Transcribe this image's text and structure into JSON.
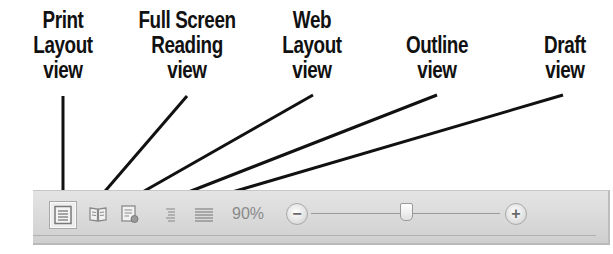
{
  "callouts": [
    {
      "id": "print-layout",
      "label": "Print\nLayout\nview",
      "label_x": 63,
      "line": {
        "x1": 63,
        "y1": 96,
        "x2": 63,
        "y2": 196
      }
    },
    {
      "id": "full-screen-reading",
      "label": "Full Screen\nReading\nview",
      "label_x": 187,
      "line": {
        "x1": 187,
        "y1": 96,
        "x2": 100,
        "y2": 197
      }
    },
    {
      "id": "web-layout",
      "label": "Web\nLayout\nview",
      "label_x": 312,
      "line": {
        "x1": 313,
        "y1": 95,
        "x2": 132,
        "y2": 198
      }
    },
    {
      "id": "outline",
      "label": "Outline\nview",
      "label_x": 437,
      "line": {
        "x1": 437,
        "y1": 95,
        "x2": 168,
        "y2": 200
      }
    },
    {
      "id": "draft",
      "label": "Draft\nview",
      "label_x": 565,
      "line": {
        "x1": 563,
        "y1": 95,
        "x2": 205,
        "y2": 200
      }
    }
  ],
  "statusbar": {
    "view_buttons": [
      {
        "id": "print-layout",
        "icon": "print-layout-icon",
        "active": true
      },
      {
        "id": "full-screen-reading",
        "icon": "full-screen-reading-icon",
        "active": false
      },
      {
        "id": "web-layout",
        "icon": "web-layout-icon",
        "active": false
      },
      {
        "id": "outline",
        "icon": "outline-icon",
        "active": false
      },
      {
        "id": "draft",
        "icon": "draft-icon",
        "active": false
      }
    ],
    "zoom_level": "90%",
    "zoom_out_label": "−",
    "zoom_in_label": "+",
    "zoom_slider_position": 0.45
  },
  "colors": {
    "line": "#111111",
    "statusbar_bg": "#dcdcdc",
    "icon_gray": "#8c8c8c"
  }
}
